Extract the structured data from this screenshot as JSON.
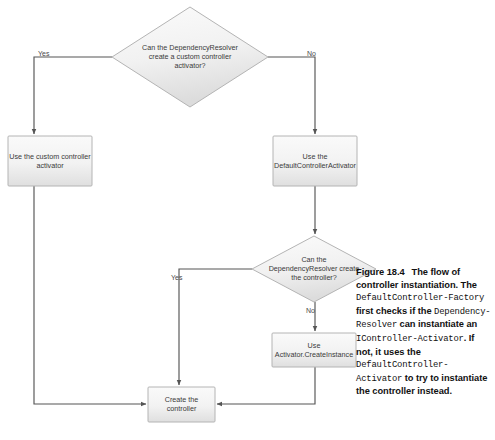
{
  "figure": {
    "type": "flowchart",
    "title": "The flow of controller instantiation",
    "caption": {
      "number": "Figure 18.4",
      "segments": [
        {
          "text": "The flow of controller instantiation. ",
          "style": "bold"
        },
        {
          "text": "The ",
          "style": "bold"
        },
        {
          "text": "DefaultController-Factory",
          "style": "mono"
        },
        {
          "text": " first checks if the ",
          "style": "bold"
        },
        {
          "text": "Dependency-Resolver",
          "style": "mono"
        },
        {
          "text": " can instantiate an ",
          "style": "bold"
        },
        {
          "text": "IController-Activator",
          "style": "mono"
        },
        {
          "text": ". If not, it uses the ",
          "style": "bold"
        },
        {
          "text": "DefaultController-Activator",
          "style": "mono"
        },
        {
          "text": " to try to instantiate the controller instead.",
          "style": "bold"
        }
      ],
      "plain_text": "Figure 18.4  The flow of controller instantiation. The DefaultControllerFactory first checks if the DependencyResolver can instantiate an IControllerActivator. If not, it uses the DefaultControllerActivator to try to instantiate the controller instead."
    }
  },
  "nodes": [
    {
      "id": "decision-resolver-activator",
      "shape": "diamond",
      "label": "Can the DependencyResolver\ncreate a custom controller\nactivator?",
      "cx": 190,
      "cy": 57,
      "rx": 78,
      "ry": 50
    },
    {
      "id": "use-custom-activator",
      "shape": "rectangle",
      "label": "Use the custom controller\nactivator",
      "x": 8,
      "y": 136,
      "w": 84,
      "h": 50
    },
    {
      "id": "use-default-activator",
      "shape": "rectangle",
      "label": "Use the\nDefaultControllerActivator",
      "x": 273,
      "y": 136,
      "w": 84,
      "h": 50
    },
    {
      "id": "decision-resolver-controller",
      "shape": "diamond",
      "label": "Can the\nDependencyResolver create\nthe controller?",
      "cx": 314,
      "cy": 269,
      "rx": 62,
      "ry": 33
    },
    {
      "id": "use-activator-createinstance",
      "shape": "rectangle",
      "label": "Use\nActivator.CreateInstance",
      "x": 272,
      "y": 333,
      "w": 84,
      "h": 34
    },
    {
      "id": "create-the-controller",
      "shape": "rectangle",
      "label": "Create the\ncontroller",
      "x": 148,
      "y": 387,
      "w": 67,
      "h": 35
    }
  ],
  "edges": [
    {
      "id": "edge-yes-custom",
      "from": "decision-resolver-activator",
      "to": "use-custom-activator",
      "label": "Yes",
      "label_x": 38,
      "label_y": 50
    },
    {
      "id": "edge-no-default",
      "from": "decision-resolver-activator",
      "to": "use-default-activator",
      "label": "No",
      "label_x": 307,
      "label_y": 50
    },
    {
      "id": "edge-custom-create",
      "from": "use-custom-activator",
      "to": "create-the-controller",
      "label": ""
    },
    {
      "id": "edge-default-decision",
      "from": "use-default-activator",
      "to": "decision-resolver-controller",
      "label": ""
    },
    {
      "id": "edge-yes-create",
      "from": "decision-resolver-controller",
      "to": "create-the-controller",
      "label": "Yes",
      "label_x": 171,
      "label_y": 274
    },
    {
      "id": "edge-no-activator",
      "from": "decision-resolver-controller",
      "to": "use-activator-createinstance",
      "label": "No",
      "label_x": 306,
      "label_y": 308
    },
    {
      "id": "edge-activator-create",
      "from": "use-activator-createinstance",
      "to": "create-the-controller",
      "label": ""
    }
  ],
  "colors": {
    "node_fill_top": "#f7f7f7",
    "node_fill_bottom": "#e4e4e4",
    "node_stroke": "#b0b0b0",
    "edge_stroke": "#555555",
    "label_text": "#3a3a3a",
    "caption_text": "#111111",
    "background": "#ffffff"
  }
}
